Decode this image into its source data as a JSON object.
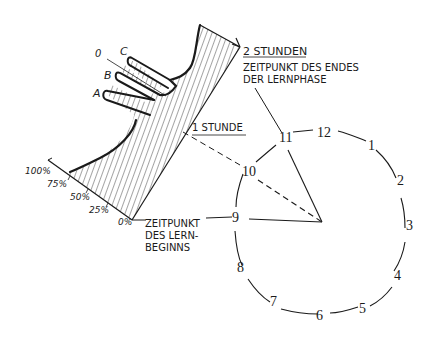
{
  "diagram": {
    "colors": {
      "ink": "#1a1a1a",
      "background": "#ffffff"
    },
    "learning_curve": {
      "percent_axis_labels": [
        "100%",
        "75%",
        "50%",
        "25%",
        "0%"
      ],
      "tine_labels": [
        "0",
        "C",
        "B",
        "A"
      ]
    },
    "labels": {
      "two_hours_title": "2 STUNDEN",
      "two_hours_line1": "ZEITPUNKT DES ENDES",
      "two_hours_line2": "DER LERNPHASE",
      "one_hour": "1 STUNDE",
      "start_line1": "ZEITPUNKT",
      "start_line2": "DES LERN-",
      "start_line3": "BEGINNS"
    },
    "clock": {
      "numbers": [
        "12",
        "1",
        "2",
        "3",
        "4",
        "5",
        "6",
        "7",
        "8",
        "9",
        "10",
        "11"
      ]
    }
  }
}
